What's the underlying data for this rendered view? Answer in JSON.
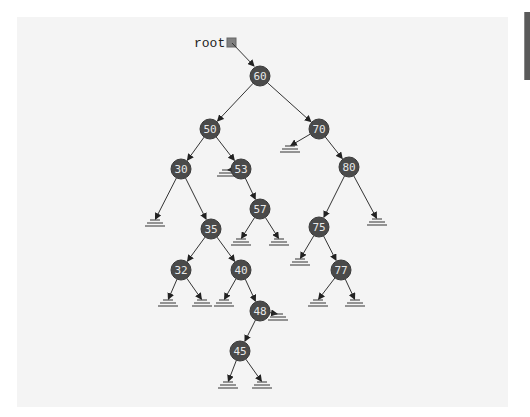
{
  "root_label": "root",
  "colors": {
    "canvas_bg": "#f4f4f4",
    "node_fill": "#4a4a4a",
    "node_text": "#e8e8e8",
    "edge": "#333333",
    "root_box": "#808080"
  },
  "tree": {
    "root": "60",
    "nodes": [
      {
        "id": "60",
        "label": "60",
        "x": 260,
        "y": 76,
        "left": "50",
        "right": "70"
      },
      {
        "id": "50",
        "label": "50",
        "x": 210,
        "y": 129,
        "left": "30",
        "right": "53"
      },
      {
        "id": "70",
        "label": "70",
        "x": 319,
        "y": 129,
        "left": null,
        "right": "80"
      },
      {
        "id": "30",
        "label": "30",
        "x": 181,
        "y": 169,
        "left": null,
        "right": "35"
      },
      {
        "id": "53",
        "label": "53",
        "x": 241,
        "y": 169,
        "left": null,
        "right": "57"
      },
      {
        "id": "80",
        "label": "80",
        "x": 349,
        "y": 167,
        "left": "75",
        "right": null
      },
      {
        "id": "57",
        "label": "57",
        "x": 260,
        "y": 209,
        "left": null,
        "right": null
      },
      {
        "id": "35",
        "label": "35",
        "x": 211,
        "y": 229,
        "left": "32",
        "right": "40"
      },
      {
        "id": "75",
        "label": "75",
        "x": 319,
        "y": 227,
        "left": null,
        "right": "77"
      },
      {
        "id": "32",
        "label": "32",
        "x": 181,
        "y": 270,
        "left": null,
        "right": null
      },
      {
        "id": "40",
        "label": "40",
        "x": 241,
        "y": 270,
        "left": null,
        "right": "48"
      },
      {
        "id": "77",
        "label": "77",
        "x": 341,
        "y": 270,
        "left": null,
        "right": null
      },
      {
        "id": "48",
        "label": "48",
        "x": 260,
        "y": 311,
        "left": "45",
        "right": null
      },
      {
        "id": "45",
        "label": "45",
        "x": 240,
        "y": 351,
        "left": null,
        "right": null
      }
    ],
    "null_links": [
      {
        "from": "70",
        "x": 290,
        "y": 148
      },
      {
        "from": "30",
        "x": 155,
        "y": 222
      },
      {
        "from": "53",
        "x": 227,
        "y": 172
      },
      {
        "from": "57",
        "x": 241,
        "y": 241
      },
      {
        "from": "57",
        "x": 279,
        "y": 241
      },
      {
        "from": "80",
        "x": 377,
        "y": 221
      },
      {
        "from": "75",
        "x": 300,
        "y": 261
      },
      {
        "from": "32",
        "x": 168,
        "y": 302
      },
      {
        "from": "32",
        "x": 202,
        "y": 302
      },
      {
        "from": "40",
        "x": 224,
        "y": 302
      },
      {
        "from": "77",
        "x": 318,
        "y": 302
      },
      {
        "from": "77",
        "x": 355,
        "y": 302
      },
      {
        "from": "48",
        "x": 278,
        "y": 316
      },
      {
        "from": "45",
        "x": 228,
        "y": 384
      },
      {
        "from": "45",
        "x": 262,
        "y": 384
      }
    ]
  }
}
